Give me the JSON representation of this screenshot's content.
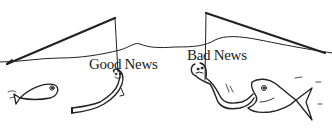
{
  "illustration": {
    "description": "Cartoon of two fishing rods with worms as bait",
    "left_label": "Good News",
    "right_label": "Bad News",
    "ink_color": "#222222",
    "background": "#ffffff"
  }
}
